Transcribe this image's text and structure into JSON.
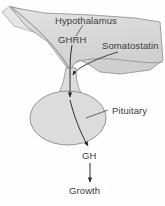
{
  "figure": {
    "background_color": "#fefefe",
    "label_color": "#3b3b3b",
    "tissue_fill": "#d9d9d9",
    "tissue_stroke": "#8a8a8a",
    "arrow_color": "#2e2e2e"
  },
  "labels": {
    "hypothalamus": "Hypothalamus",
    "ghrh": "GHRH",
    "somatostatin": "Somatostatin",
    "pituitary": "Pituitary",
    "gh": "GH",
    "growth": "Growth"
  },
  "diagram_structure": {
    "nodes": [
      {
        "id": "hypothalamus",
        "label": "Hypothalamus",
        "type": "anatomical-region"
      },
      {
        "id": "ghrh",
        "label": "GHRH",
        "type": "hormone"
      },
      {
        "id": "somatostatin",
        "label": "Somatostatin",
        "type": "hormone"
      },
      {
        "id": "pituitary",
        "label": "Pituitary",
        "type": "anatomical-region"
      },
      {
        "id": "gh",
        "label": "GH",
        "type": "hormone"
      },
      {
        "id": "growth",
        "label": "Growth",
        "type": "outcome"
      }
    ],
    "edges": [
      {
        "from": "ghrh",
        "to": "pituitary",
        "kind": "arrow"
      },
      {
        "from": "somatostatin",
        "to": "pituitary",
        "kind": "arrow"
      },
      {
        "from": "pituitary",
        "to": "gh",
        "kind": "arrow"
      },
      {
        "from": "gh",
        "to": "growth",
        "kind": "arrow"
      }
    ]
  }
}
